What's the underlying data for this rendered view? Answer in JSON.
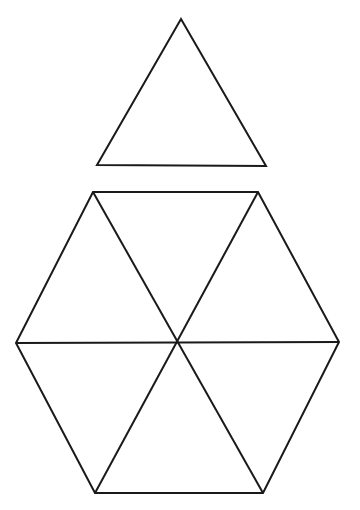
{
  "canvas": {
    "width": 360,
    "height": 510,
    "background_color": "#ffffff",
    "stroke_color": "#1a1a1a",
    "stroke_width": 2,
    "fill": "none"
  },
  "figure": {
    "shape_count": 2
  },
  "shapes": [
    {
      "id": "top-triangle",
      "name": "equilateral-triangle",
      "sides": 3,
      "points": "181,19 266,166 97,165",
      "vertices": [
        {
          "label": "apex",
          "x": 181,
          "y": 19
        },
        {
          "label": "bottom-right",
          "x": 266,
          "y": 166
        },
        {
          "label": "bottom-left",
          "x": 97,
          "y": 165
        }
      ],
      "centroid": {
        "x": 181,
        "y": 117
      },
      "base_width": 169,
      "height": 147
    },
    {
      "id": "hexagon",
      "name": "regular-hexagon",
      "sides": 6,
      "points": "93,192 258,192 339,342 263,493 95,493 16,343",
      "vertices": [
        {
          "label": "top-left",
          "x": 93,
          "y": 192
        },
        {
          "label": "top-right",
          "x": 258,
          "y": 192
        },
        {
          "label": "right",
          "x": 339,
          "y": 342
        },
        {
          "label": "bottom-right",
          "x": 263,
          "y": 493
        },
        {
          "label": "bottom-left",
          "x": 95,
          "y": 493
        },
        {
          "label": "left",
          "x": 16,
          "y": 343
        }
      ],
      "center": {
        "x": 177,
        "y": 342
      },
      "width": 323,
      "height": 301,
      "internal_triangles": 6
    }
  ],
  "diagonals": [
    {
      "id": "diagonal-horizontal",
      "name": "left-to-right-diagonal",
      "from": {
        "label": "left",
        "x": 16,
        "y": 343
      },
      "to": {
        "label": "right",
        "x": 339,
        "y": 342
      }
    },
    {
      "id": "diagonal-topleft-bottomright",
      "name": "top-left-to-bottom-right-diagonal",
      "from": {
        "label": "top-left",
        "x": 93,
        "y": 192
      },
      "to": {
        "label": "bottom-right",
        "x": 263,
        "y": 493
      }
    },
    {
      "id": "diagonal-topright-bottomleft",
      "name": "top-right-to-bottom-left-diagonal",
      "from": {
        "label": "top-right",
        "x": 258,
        "y": 192
      },
      "to": {
        "label": "bottom-left",
        "x": 95,
        "y": 493
      }
    }
  ]
}
